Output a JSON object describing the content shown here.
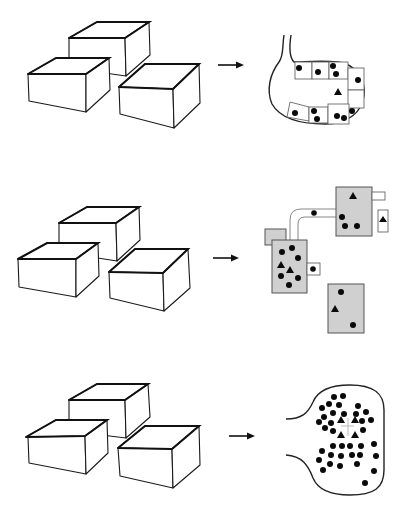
{
  "figure": {
    "rows": [
      {
        "id": "row-1",
        "left": "three-boxes",
        "arrow": "right-arrow",
        "right": "pouch-with-compartments",
        "right_contents": {
          "dots": 11,
          "triangles": 1,
          "compartments": 8
        }
      },
      {
        "id": "row-2",
        "left": "three-boxes",
        "arrow": "right-arrow",
        "right": "connected-grey-cells",
        "right_contents": {
          "grey_cells": 3,
          "dots": 14,
          "triangles": 5,
          "connecting_tube": true
        }
      },
      {
        "id": "row-3",
        "left": "three-boxes",
        "arrow": "right-arrow",
        "right": "pouch-with-dense-dots",
        "right_contents": {
          "dots": 52,
          "triangles": 4
        }
      }
    ],
    "colors": {
      "stroke": "#111111",
      "cell_fill": "#d0d0d0",
      "background": "#ffffff"
    }
  }
}
